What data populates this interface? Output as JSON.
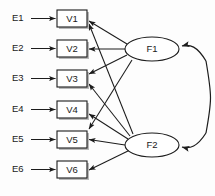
{
  "diagram": {
    "type": "sem-path-diagram",
    "title": "",
    "background_color": "#fdfdfd",
    "line_color": "#1c1c1c",
    "shadow_color": "#b9b9b9",
    "indicators": [
      {
        "id": "V1",
        "label": "V1",
        "x": 57,
        "y": 10,
        "w": 30,
        "h": 17
      },
      {
        "id": "V2",
        "label": "V2",
        "x": 57,
        "y": 40,
        "w": 30,
        "h": 17
      },
      {
        "id": "V3",
        "label": "V3",
        "x": 57,
        "y": 70,
        "w": 30,
        "h": 17
      },
      {
        "id": "V4",
        "label": "V4",
        "x": 57,
        "y": 101,
        "w": 30,
        "h": 17
      },
      {
        "id": "V5",
        "label": "V5",
        "x": 57,
        "y": 131,
        "w": 30,
        "h": 17
      },
      {
        "id": "V6",
        "label": "V6",
        "x": 57,
        "y": 161,
        "w": 30,
        "h": 17
      }
    ],
    "errors": [
      {
        "id": "E1",
        "label": "E1",
        "x": 12,
        "y": 18,
        "target": "V1"
      },
      {
        "id": "E2",
        "label": "E2",
        "x": 12,
        "y": 48,
        "target": "V2"
      },
      {
        "id": "E3",
        "label": "E3",
        "x": 12,
        "y": 78,
        "target": "V3"
      },
      {
        "id": "E4",
        "label": "E4",
        "x": 12,
        "y": 109,
        "target": "V4"
      },
      {
        "id": "E5",
        "label": "E5",
        "x": 12,
        "y": 139,
        "target": "V5"
      },
      {
        "id": "E6",
        "label": "E6",
        "x": 12,
        "y": 169,
        "target": "V6"
      }
    ],
    "factors": [
      {
        "id": "F1",
        "label": "F1",
        "cx": 152,
        "cy": 49,
        "rx": 27,
        "ry": 12
      },
      {
        "id": "F2",
        "label": "F2",
        "cx": 152,
        "cy": 145,
        "rx": 27,
        "ry": 12
      }
    ],
    "loadings": [
      {
        "from": "F1",
        "to": "V1"
      },
      {
        "from": "F1",
        "to": "V2"
      },
      {
        "from": "F1",
        "to": "V3"
      },
      {
        "from": "F1",
        "to": "V5"
      },
      {
        "from": "F2",
        "to": "V1"
      },
      {
        "from": "F2",
        "to": "V3"
      },
      {
        "from": "F2",
        "to": "V4"
      },
      {
        "from": "F2",
        "to": "V5"
      },
      {
        "from": "F2",
        "to": "V6"
      }
    ],
    "covariance": {
      "between": [
        "F1",
        "F2"
      ],
      "double_headed": true,
      "side": "right"
    }
  }
}
